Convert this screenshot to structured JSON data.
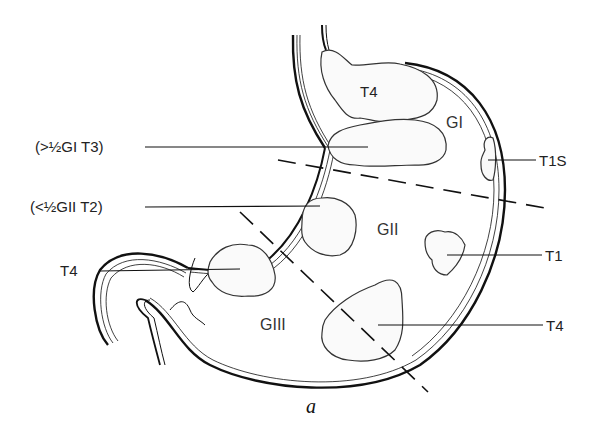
{
  "figure": {
    "caption": "a",
    "regions": [
      {
        "id": "GI",
        "label": "GI"
      },
      {
        "id": "GII",
        "label": "GII"
      },
      {
        "id": "GIII",
        "label": "GIII"
      }
    ],
    "tumor_labels": {
      "fundus_T4": "T4",
      "left_T3": "(>½GI T3)",
      "left_T2": "(<½GII T2)",
      "left_T4": "T4",
      "right_T1S": "T1S",
      "right_T1": "T1",
      "right_T4": "T4"
    },
    "colors": {
      "ink": "#111111",
      "background": "#ffffff",
      "tumor_fill": "#fafafa"
    }
  }
}
